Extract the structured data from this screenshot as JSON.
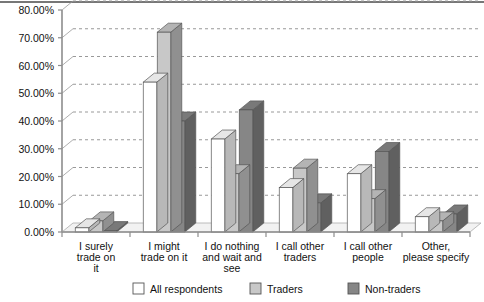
{
  "chart_data": {
    "type": "bar",
    "title": "",
    "subtitle": "",
    "xlabel": "",
    "ylabel": "",
    "ylim": [
      0,
      80
    ],
    "ytick_step": 10,
    "grid": true,
    "grid_style": "dashed",
    "style": "3d-grouped-column",
    "legend_position": "bottom",
    "value_suffix": "%",
    "categories": [
      "I surely trade on it",
      "I might trade on it",
      "I do nothing and wait and see",
      "I call other traders",
      "I call other people",
      "Other, please specify"
    ],
    "ytick_labels": [
      "0.00%",
      "10.00%",
      "20.00%",
      "30.00%",
      "40.00%",
      "50.00%",
      "60.00%",
      "70.00%",
      "80.00%"
    ],
    "ytick_values": [
      0,
      10,
      20,
      30,
      40,
      50,
      60,
      70,
      80
    ],
    "series": [
      {
        "name": "All respondents",
        "color": "#ffffff",
        "values": [
          1.5,
          54.0,
          33.5,
          16.0,
          21.0,
          5.5
        ]
      },
      {
        "name": "Traders",
        "color": "#c8c8c8",
        "values": [
          4.0,
          72.0,
          21.0,
          23.0,
          12.0,
          4.0
        ]
      },
      {
        "name": "Non-traders",
        "color": "#868686",
        "values": [
          0.5,
          40.0,
          44.0,
          10.5,
          29.0,
          6.5
        ]
      }
    ]
  },
  "legend": {
    "items": [
      {
        "label": "All respondents",
        "color": "#ffffff"
      },
      {
        "label": "Traders",
        "color": "#c8c8c8"
      },
      {
        "label": "Non-traders",
        "color": "#868686"
      }
    ]
  },
  "axis": {
    "y_labels": [
      "80.00%",
      "70.00%",
      "60.00%",
      "50.00%",
      "40.00%",
      "30.00%",
      "20.00%",
      "10.00%",
      "0.00%"
    ],
    "x_labels": [
      [
        "I surely",
        "trade on",
        "it"
      ],
      [
        "I might",
        "trade on it"
      ],
      [
        "I do nothing",
        "and wait and",
        "see"
      ],
      [
        "I call other",
        "traders"
      ],
      [
        "I call other",
        "people"
      ],
      [
        "Other,",
        "please specify"
      ]
    ]
  },
  "colors": {
    "series_all": "#ffffff",
    "series_traders": "#c8c8c8",
    "series_nontraders": "#868686",
    "grid": "#999999",
    "axis": "#8d8d8d",
    "text": "#111111",
    "top_border": "#4a4a4a"
  }
}
